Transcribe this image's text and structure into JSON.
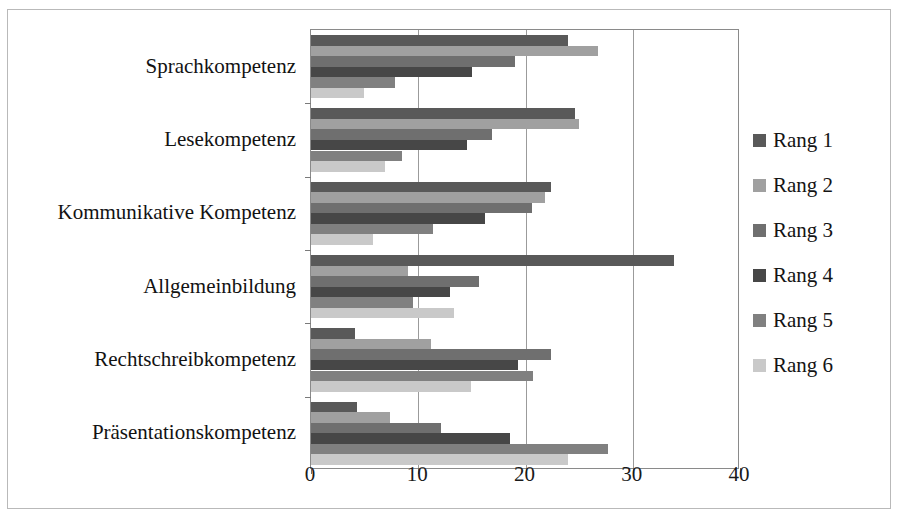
{
  "chart_data": {
    "type": "bar",
    "orientation": "horizontal",
    "title": "",
    "xlabel": "",
    "ylabel": "",
    "xlim": [
      0,
      40
    ],
    "xticks": [
      0,
      10,
      20,
      30,
      40
    ],
    "xtick_labels": [
      "0",
      "10",
      "20",
      "30",
      "40"
    ],
    "grid": "vertical",
    "legend_position": "right",
    "categories": [
      "Sprachkompetenz",
      "Lesekompetenz",
      "Kommunikative Kompetenz",
      "Allgemeinbildung",
      "Rechtschreibkompetenz",
      "Präsentationskompetenz"
    ],
    "series": [
      {
        "name": "Rang 1",
        "color": "#595959",
        "values": [
          24.0,
          24.6,
          22.4,
          33.8,
          4.1,
          4.3
        ]
      },
      {
        "name": "Rang 2",
        "color": "#a0a0a0",
        "values": [
          26.8,
          25.0,
          21.8,
          9.0,
          11.2,
          7.4
        ]
      },
      {
        "name": "Rang 3",
        "color": "#6f6f6f",
        "values": [
          19.0,
          16.9,
          20.6,
          15.7,
          22.4,
          12.1
        ]
      },
      {
        "name": "Rang 4",
        "color": "#474747",
        "values": [
          15.0,
          14.5,
          16.2,
          13.0,
          19.3,
          18.6
        ]
      },
      {
        "name": "Rang 5",
        "color": "#808080",
        "values": [
          7.8,
          8.5,
          11.4,
          9.5,
          20.7,
          27.7
        ]
      },
      {
        "name": "Rang 6",
        "color": "#c9c9c9",
        "values": [
          4.9,
          6.9,
          5.8,
          13.3,
          14.9,
          24.0
        ]
      }
    ]
  },
  "legend": {
    "items": [
      {
        "label": "Rang 1"
      },
      {
        "label": "Rang 2"
      },
      {
        "label": "Rang 3"
      },
      {
        "label": "Rang 4"
      },
      {
        "label": "Rang 5"
      },
      {
        "label": "Rang 6"
      }
    ]
  }
}
